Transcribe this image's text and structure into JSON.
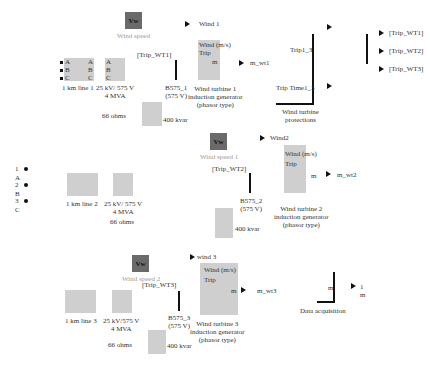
{
  "wind_speed": [
    {
      "icon": "Vw",
      "label": "Wind speed"
    },
    {
      "icon": "Vw",
      "label": "Wind speed 1"
    },
    {
      "icon": "Vw",
      "label": "Wind speed 2"
    }
  ],
  "wind_tags": [
    "Wind 1",
    "Wind2",
    "wind 3"
  ],
  "trip_tags": [
    "[Trip_WT1]",
    "[Trip_WT2]",
    "[Trip_WT3]"
  ],
  "lines": [
    "1 km line 1",
    "1 km line 2",
    "1 km line  3"
  ],
  "transformers": [
    {
      "l1": "25 kV/ 575 V",
      "l2": "4 MVA"
    },
    {
      "l1": "25 kV/ 575 V",
      "l2": "4 MVA"
    },
    {
      "l1": "25 kV/575 V",
      "l2": "4 MVA"
    }
  ],
  "grounding": [
    "66 ohms",
    "66 ohms",
    "66 ohms"
  ],
  "capacitors": [
    "400 kvar",
    "400 kvar",
    "400 kvar"
  ],
  "buses": [
    {
      "l1": "B575_1",
      "l2": "(575 V)"
    },
    {
      "l1": "B575_2",
      "l2": "(575 V)"
    },
    {
      "l1": "B575_3",
      "l2": "(575 V)"
    }
  ],
  "turbines": [
    {
      "l1": "Wind turbine 1",
      "l2": "induction generator",
      "l3": "(phasor type)",
      "out": "m_wt1"
    },
    {
      "l1": "Wind turbine 2",
      "l2": "induction generator",
      "l3": "(phasor type)",
      "out": "m_wt2"
    },
    {
      "l1": "Wind turbine 3",
      "l2": "induction generator",
      "l3": "(phasor type)",
      "out": "m_wt3"
    }
  ],
  "turbine_ports": {
    "wind": "Wind (m/s)",
    "trip": "Trip",
    "a": "A",
    "b": "B",
    "c": "C",
    "m": "m"
  },
  "abc": {
    "a": "A",
    "b": "B",
    "c": "C"
  },
  "protections": {
    "label1": "Wind turbine",
    "label2": "protections",
    "in1": "Trip1_3",
    "in2": "Trip Time1_3"
  },
  "trip_outputs": [
    "[Trip_WT1]",
    "[Trip_WT2]",
    "[Trip_WT3]"
  ],
  "source_ports": [
    "1",
    "A",
    "2",
    "B",
    "3",
    "C"
  ],
  "data_acq": {
    "label": "Data acquisition",
    "in": "m",
    "out1": "1",
    "out2": "m"
  }
}
